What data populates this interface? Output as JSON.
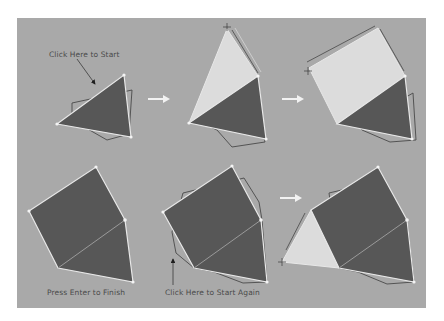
{
  "colors": {
    "panel": "#a9a9a9",
    "dark_fill": "#575757",
    "light_fill": "#dcdcdc",
    "edge": "#e8e8e8",
    "outline": "#4a4a4a",
    "arrow": "#f2f2f2"
  },
  "labels": {
    "start": "Click Here to Start",
    "finish": "Press Enter to Finish",
    "start_again": "Click Here to Start Again"
  },
  "steps": [
    {
      "id": 1,
      "row": 1,
      "description": "Initial triangle with outline, arrow pointing to start vertex"
    },
    {
      "id": 2,
      "row": 1,
      "description": "Light triangle extended upward from top edge"
    },
    {
      "id": 3,
      "row": 1,
      "description": "Light square extended from triangle edge"
    },
    {
      "id": 4,
      "row": 2,
      "description": "Finished dark pentagon (square + triangle)"
    },
    {
      "id": 5,
      "row": 2,
      "description": "Pentagon with outline, arrow pointing to restart vertex"
    },
    {
      "id": 6,
      "row": 2,
      "description": "New light triangle added to pentagon left edge"
    }
  ],
  "flow_arrows": [
    {
      "from": 1,
      "to": 2
    },
    {
      "from": 2,
      "to": 3
    },
    {
      "from": 5,
      "to": 6
    }
  ]
}
